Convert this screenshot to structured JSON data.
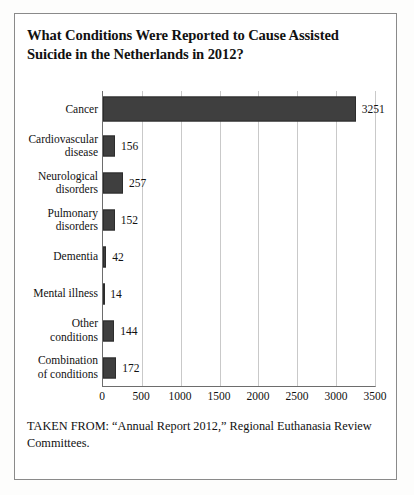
{
  "figure": {
    "title": "What Conditions Were Reported to Cause Assisted Suicide in the Netherlands in 2012?",
    "source_note": "TAKEN FROM: “Annual Report 2012,” Regional Euthanasia Review Committees."
  },
  "colors": {
    "bar_fill": "#3f3f3f",
    "bar_stroke": "#2c2c2c",
    "gridline": "#c9c9c9",
    "axis": "#6d6d6d",
    "frame": "#8a8a8a",
    "text": "#111111",
    "background": "#ffffff"
  },
  "chart_data": {
    "type": "bar",
    "orientation": "horizontal",
    "title": "What Conditions Were Reported to Cause Assisted Suicide in the Netherlands in 2012?",
    "xlabel": "",
    "ylabel": "",
    "xlim": [
      0,
      3500
    ],
    "grid": true,
    "legend": "none",
    "xticks": [
      0,
      500,
      1000,
      1500,
      2000,
      2500,
      3000,
      3500
    ],
    "xtick_labels": [
      "0",
      "500",
      "1000",
      "1500",
      "2000",
      "2500",
      "3000",
      "3500"
    ],
    "categories": [
      "Cancer",
      "Cardiovascular disease",
      "Neurological disorders",
      "Pulmonary disorders",
      "Dementia",
      "Mental illness",
      "Other conditions",
      "Combination of conditions"
    ],
    "values": [
      3251,
      156,
      257,
      152,
      42,
      14,
      144,
      172
    ],
    "data_labels": [
      "3251",
      "156",
      "257",
      "152",
      "42",
      "14",
      "144",
      "172"
    ],
    "bars": [
      {
        "label_line1": "Cancer",
        "label_line2": "",
        "value": 3251,
        "data_label": "3251"
      },
      {
        "label_line1": "Cardiovascular",
        "label_line2": "disease",
        "value": 156,
        "data_label": "156"
      },
      {
        "label_line1": "Neurological",
        "label_line2": "disorders",
        "value": 257,
        "data_label": "257"
      },
      {
        "label_line1": "Pulmonary",
        "label_line2": "disorders",
        "value": 152,
        "data_label": "152"
      },
      {
        "label_line1": "Dementia",
        "label_line2": "",
        "value": 42,
        "data_label": "42"
      },
      {
        "label_line1": "Mental illness",
        "label_line2": "",
        "value": 14,
        "data_label": "14"
      },
      {
        "label_line1": "Other",
        "label_line2": "conditions",
        "value": 144,
        "data_label": "144"
      },
      {
        "label_line1": "Combination",
        "label_line2": "of conditions",
        "value": 172,
        "data_label": "172"
      }
    ]
  }
}
